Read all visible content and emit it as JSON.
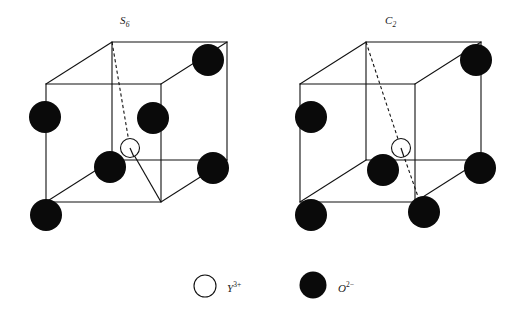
{
  "figure": {
    "background_color": "#ffffff",
    "line_color": "#111111",
    "atom_fill_o": "#0a0a0a",
    "atom_fill_y": "#ffffff",
    "width": 525,
    "height": 318
  },
  "panels": [
    {
      "id": "panel-s6",
      "label": "S",
      "label_sub": "6",
      "label_full": "S6",
      "label_x": 120,
      "label_y": 14,
      "cube": {
        "front": {
          "x": 46,
          "y": 84,
          "w": 115,
          "h": 118
        },
        "depth_dx": 66,
        "depth_dy": -42
      },
      "symmetry_axis": {
        "type": "S6",
        "from_vertex": "back-top-left",
        "to_vertex": "front-bottom-right",
        "x1": 112,
        "y1": 70,
        "x2": 161,
        "y2": 220,
        "dashed_until_center": true
      },
      "center_atom": {
        "species": "Y3+",
        "cx": 130,
        "cy": 148,
        "r": 9.5
      },
      "oxygen_atoms": [
        {
          "cx": 208,
          "cy": 60,
          "r": 16,
          "site": "back-top-right"
        },
        {
          "cx": 45,
          "cy": 117,
          "r": 16,
          "site": "front-top-left"
        },
        {
          "cx": 153,
          "cy": 118,
          "r": 16,
          "site": "interior-upper-right"
        },
        {
          "cx": 110,
          "cy": 167,
          "r": 16,
          "site": "interior-lower-left"
        },
        {
          "cx": 213,
          "cy": 168,
          "r": 16,
          "site": "back-mid-right"
        },
        {
          "cx": 46,
          "cy": 215,
          "r": 16,
          "site": "front-bottom-left"
        }
      ]
    },
    {
      "id": "panel-c2",
      "label": "C",
      "label_sub": "2",
      "label_full": "C2",
      "label_x": 385,
      "label_y": 14,
      "cube": {
        "front": {
          "x": 300,
          "y": 84,
          "w": 115,
          "h": 118
        },
        "depth_dx": 66,
        "depth_dy": -42
      },
      "symmetry_axis": {
        "type": "C2",
        "from_vertex": "back-top-left",
        "to_vertex": "front-bottom-right-atom",
        "x1": 378,
        "y1": 70,
        "x2": 422,
        "y2": 208,
        "dashed_until_center": true
      },
      "center_atom": {
        "species": "Y3+",
        "cx": 401,
        "cy": 148,
        "r": 9.5
      },
      "oxygen_atoms": [
        {
          "cx": 476,
          "cy": 60,
          "r": 16,
          "site": "back-top-right"
        },
        {
          "cx": 311,
          "cy": 117,
          "r": 16,
          "site": "front-top-left"
        },
        {
          "cx": 383,
          "cy": 170,
          "r": 16,
          "site": "interior-lower-left"
        },
        {
          "cx": 480,
          "cy": 168,
          "r": 16,
          "site": "back-mid-right"
        },
        {
          "cx": 311,
          "cy": 215,
          "r": 16,
          "site": "front-bottom-left"
        },
        {
          "cx": 424,
          "cy": 212,
          "r": 16,
          "site": "front-bottom-right"
        }
      ]
    }
  ],
  "legend": {
    "items": [
      {
        "marker": "open-circle",
        "species_symbol": "Y",
        "species_charge": "3+",
        "species_full": "Y3+",
        "marker_cx": 205,
        "marker_cy": 286,
        "marker_r": 11,
        "label_x": 227,
        "label_y": 280
      },
      {
        "marker": "filled-circle",
        "species_symbol": "O",
        "species_charge": "2−",
        "species_full": "O2-",
        "marker_cx": 313,
        "marker_cy": 285,
        "marker_r": 13.5,
        "label_x": 338,
        "label_y": 280
      }
    ]
  }
}
